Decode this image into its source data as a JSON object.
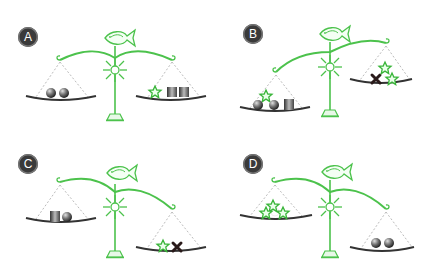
{
  "header": {
    "text_partial": "(cropped question text)"
  },
  "colors": {
    "scale_green": "#4cc24c",
    "pan_dark": "#333333",
    "badge_bg": "#3a3a3a",
    "string_gray": "#aaaaaa"
  },
  "options": [
    {
      "label": "A",
      "tilt": "level",
      "left_pan": [
        "sphere",
        "sphere"
      ],
      "right_pan": [
        "star",
        "cube",
        "cube"
      ]
    },
    {
      "label": "B",
      "tilt": "left-down",
      "left_pan": [
        "star",
        "sphere",
        "sphere",
        "cube"
      ],
      "right_pan": [
        "x-mark",
        "star",
        "star"
      ]
    },
    {
      "label": "C",
      "tilt": "right-down",
      "left_pan": [
        "cube",
        "sphere"
      ],
      "right_pan": [
        "star",
        "x-mark"
      ]
    },
    {
      "label": "D",
      "tilt": "right-down",
      "left_pan": [
        "star",
        "star",
        "star",
        "sphere"
      ],
      "right_pan": [
        "sphere",
        "sphere"
      ]
    }
  ]
}
